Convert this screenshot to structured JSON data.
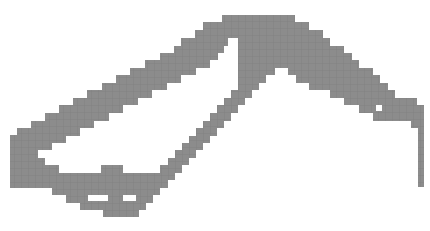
{
  "figure": {
    "fill_color": "#8c8c8c",
    "grid_color": "#7a7a7a",
    "background_color": "#ffffff",
    "cell_size_px": 7
  }
}
